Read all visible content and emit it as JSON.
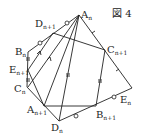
{
  "figure": {
    "title": "図 4",
    "labels": {
      "An": {
        "base": "A",
        "sub": "n"
      },
      "Dn1": {
        "base": "D",
        "sub": "n+1"
      },
      "Bn": {
        "base": "B",
        "sub": "n"
      },
      "En1": {
        "base": "E",
        "sub": "n+1"
      },
      "Cn": {
        "base": "C",
        "sub": "n"
      },
      "An1": {
        "base": "A",
        "sub": "n+1"
      },
      "Dn": {
        "base": "D",
        "sub": "n"
      },
      "Bn1": {
        "base": "B",
        "sub": "n+1"
      },
      "En": {
        "base": "E",
        "sub": "n"
      },
      "Cn1": {
        "base": "C",
        "sub": "n+1"
      }
    }
  }
}
